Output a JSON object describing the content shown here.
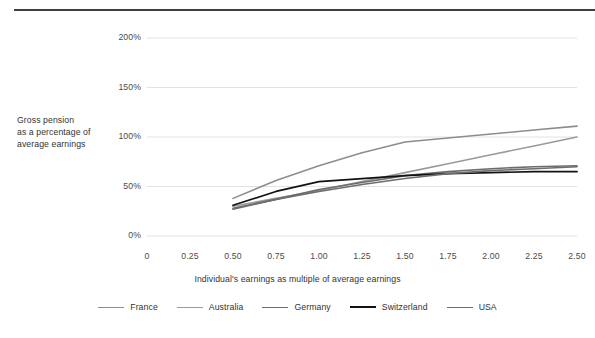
{
  "chart_data": {
    "type": "line",
    "title": "",
    "xlabel": "Individual's earnings as multiple of average earnings",
    "ylabel": "Gross pension as a percentage of average earnings",
    "ylabel_lines": [
      "Gross pension",
      "as a percentage of",
      "average earnings"
    ],
    "grid": true,
    "legend_position": "bottom",
    "xlim": [
      0,
      2.5
    ],
    "ylim": [
      0,
      200
    ],
    "xticks": [
      0,
      0.25,
      0.5,
      0.75,
      1.0,
      1.25,
      1.5,
      1.75,
      2.0,
      2.25,
      2.5
    ],
    "xticklabels": [
      "0",
      "0.25",
      "0.50",
      "0.75",
      "1.00",
      "1.25",
      "1.50",
      "1.75",
      "2.00",
      "2.25",
      "2.50"
    ],
    "yticks": [
      0,
      50,
      100,
      150,
      200
    ],
    "yticklabels": [
      "0%",
      "50%",
      "100%",
      "150%",
      "200%"
    ],
    "x": [
      0.5,
      0.75,
      1.0,
      1.25,
      1.5,
      1.75,
      2.0,
      2.25,
      2.5
    ],
    "series": [
      {
        "name": "France",
        "color": "#8d8d8d",
        "width": 1.6,
        "values": [
          38,
          56,
          71,
          84,
          95,
          99,
          103,
          107,
          111
        ]
      },
      {
        "name": "Australia",
        "color": "#9a9a9a",
        "width": 1.6,
        "values": [
          30,
          38,
          46,
          55,
          64,
          73,
          82,
          91,
          100
        ]
      },
      {
        "name": "Germany",
        "color": "#6d6d6d",
        "width": 1.6,
        "values": [
          27,
          37,
          47,
          54,
          61,
          65,
          68,
          70,
          71
        ]
      },
      {
        "name": "Switzerland",
        "color": "#121212",
        "width": 1.7,
        "values": [
          31,
          45,
          55,
          58,
          61,
          63,
          64,
          65,
          65
        ]
      },
      {
        "name": "USA",
        "color": "#6d6d6d",
        "width": 1.6,
        "values": [
          28,
          37,
          45,
          52,
          58,
          63,
          66,
          68,
          70
        ]
      }
    ]
  },
  "legend": {
    "items": [
      {
        "label": "France",
        "color": "#8d8d8d",
        "width": 1.6
      },
      {
        "label": "Australia",
        "color": "#9a9a9a",
        "width": 1.6
      },
      {
        "label": "Germany",
        "color": "#6d6d6d",
        "width": 1.6
      },
      {
        "label": "Switzerland",
        "color": "#121212",
        "width": 2.1
      },
      {
        "label": "USA",
        "color": "#6d6d6d",
        "width": 1.6
      }
    ]
  },
  "colors": {
    "grid": "#e2e2e2",
    "text": "#3a3a3a",
    "rule": "#3f3f44",
    "background": "#ffffff"
  }
}
